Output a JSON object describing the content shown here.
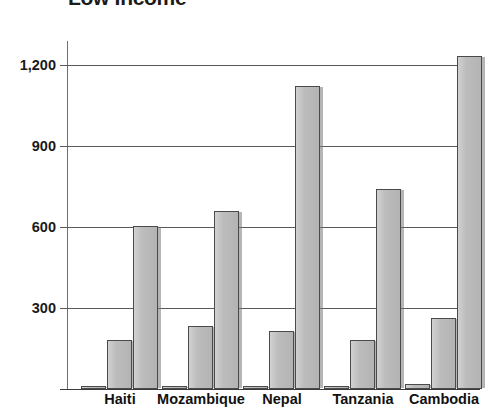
{
  "chart_data": {
    "type": "bar",
    "title": "Low Income",
    "xlabel": "",
    "ylabel": "",
    "ylim": [
      0,
      1290
    ],
    "grid": true,
    "legend": "none",
    "y_ticks": [
      "300",
      "600",
      "900",
      "1,200"
    ],
    "y_tick_values": [
      300,
      600,
      900,
      1200
    ],
    "categories": [
      "Haiti",
      "Mozambique",
      "Nepal",
      "Tanzania",
      "Cambodia"
    ],
    "series": [
      {
        "name": "Series 1",
        "values": [
          10,
          10,
          5,
          10,
          18
        ]
      },
      {
        "name": "Series 2",
        "values": [
          180,
          235,
          215,
          180,
          265
        ]
      },
      {
        "name": "Series 3",
        "values": [
          605,
          660,
          1125,
          740,
          1235
        ]
      }
    ],
    "colors": {
      "bar_fill": "#b9b9b9",
      "bar_border": "#4a4a4a",
      "gridline": "#595959",
      "axis": "#3c3c3c",
      "text": "#111111",
      "background": "#ffffff"
    }
  }
}
